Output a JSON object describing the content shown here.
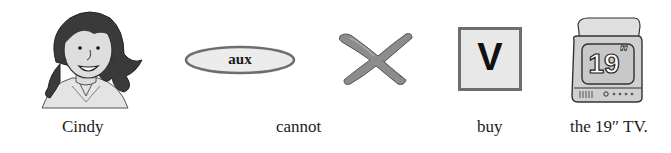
{
  "sentence": {
    "words": [
      {
        "text": "Cindy",
        "role": "subject",
        "icon": "girl-portrait-icon"
      },
      {
        "text": "cannot",
        "role": "auxiliary-negation",
        "icon": "aux-oval-icon",
        "icon_label": "aux"
      },
      {
        "text": "",
        "role": "negation",
        "icon": "cross-x-icon"
      },
      {
        "text": "buy",
        "role": "verb",
        "icon": "verb-square-icon",
        "icon_label": "V"
      },
      {
        "text": "the 19″ TV.",
        "role": "object",
        "icon": "television-icon",
        "icon_label": "19″"
      }
    ]
  },
  "labels": {
    "subject": "Cindy",
    "aux": "cannot",
    "verb": "buy",
    "object": "the 19″ TV."
  },
  "icons": {
    "aux_badge": "aux",
    "verb_badge": "V",
    "tv_screen": "19",
    "tv_screen_marks": "″"
  },
  "colors": {
    "ink": "#1c1c1c",
    "outline_gray": "#707070",
    "fill_light": "#e6e6e6",
    "cross_gray": "#8a8a8a",
    "tv_screen": "#c8c8c8"
  }
}
